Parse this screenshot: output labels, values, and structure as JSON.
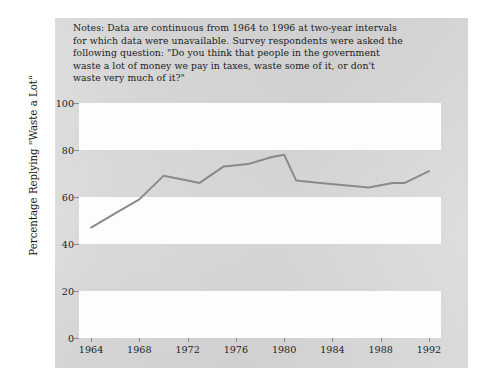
{
  "page": {
    "notes_lines": [
      "Notes: Data are continuous from 1964 to 1996 at two-year intervals",
      "for which data were unavailable. Survey respondents were asked the",
      "following question: \"Do you think that people in the government",
      "waste a lot of money we pay in taxes, waste some of it, or don't",
      "waste very much of it?\""
    ],
    "background_color": "#d7d7d7",
    "paper_color": "#fdfdfd"
  },
  "chart_data": {
    "type": "line",
    "title": "",
    "subtitle": "",
    "xlabel": "",
    "ylabel": "Percentage Replying \"Waste a Lot\"",
    "xlim": [
      1963,
      1993
    ],
    "ylim": [
      0,
      100
    ],
    "xticks": [
      1964,
      1968,
      1972,
      1976,
      1980,
      1984,
      1988,
      1992
    ],
    "xtick_labels": [
      "1964",
      "1968",
      "1972",
      "1976",
      "1980",
      "1984",
      "1988",
      "1992"
    ],
    "yticks": [
      0,
      20,
      40,
      60,
      80,
      100
    ],
    "ytick_labels": [
      "0",
      "20",
      "40",
      "60",
      "80",
      "100"
    ],
    "grid": false,
    "banded_background": true,
    "band_step": 20,
    "legend": null,
    "line_color": "#8a8a8a",
    "line_width": 2,
    "series": [
      {
        "name": "Percentage replying \"waste a lot\"",
        "x": [
          1964,
          1966,
          1968,
          1970,
          1972,
          1973,
          1975,
          1977,
          1979,
          1980,
          1981,
          1983,
          1985,
          1987,
          1989,
          1990,
          1992
        ],
        "values": [
          47,
          53,
          59,
          69,
          67,
          66,
          73,
          74,
          77,
          78,
          67,
          66,
          65,
          64,
          66,
          66,
          71
        ]
      }
    ],
    "annotations": []
  }
}
